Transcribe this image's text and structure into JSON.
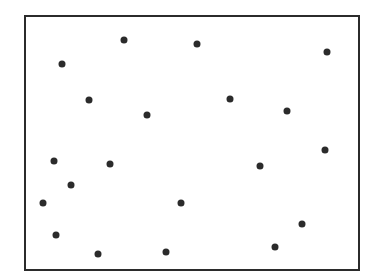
{
  "chart_data": {
    "type": "scatter",
    "title": "",
    "xlabel": "",
    "ylabel": "",
    "grid": false,
    "legend": null,
    "axes_ticks": false,
    "frame": {
      "left": 24,
      "top": 15,
      "right": 360,
      "bottom": 271
    },
    "marker_color": "#2b2b2b",
    "marker_radius": 3.5,
    "points": [
      {
        "x": 124,
        "y": 40
      },
      {
        "x": 197,
        "y": 44
      },
      {
        "x": 327,
        "y": 52
      },
      {
        "x": 62,
        "y": 64
      },
      {
        "x": 89,
        "y": 100
      },
      {
        "x": 230,
        "y": 99
      },
      {
        "x": 287,
        "y": 111
      },
      {
        "x": 147,
        "y": 115
      },
      {
        "x": 325,
        "y": 150
      },
      {
        "x": 54,
        "y": 161
      },
      {
        "x": 110,
        "y": 164
      },
      {
        "x": 260,
        "y": 166
      },
      {
        "x": 71,
        "y": 185
      },
      {
        "x": 43,
        "y": 203
      },
      {
        "x": 181,
        "y": 203
      },
      {
        "x": 302,
        "y": 224
      },
      {
        "x": 56,
        "y": 235
      },
      {
        "x": 275,
        "y": 247
      },
      {
        "x": 166,
        "y": 252
      },
      {
        "x": 98,
        "y": 254
      }
    ]
  }
}
